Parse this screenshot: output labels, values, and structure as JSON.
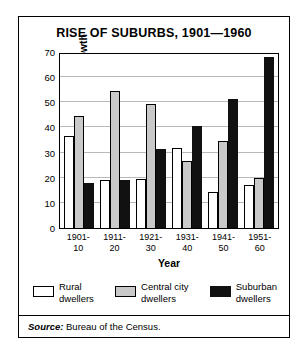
{
  "chart_data": {
    "type": "bar",
    "title": "RISE OF SUBURBS, 1901—1960",
    "xlabel": "Year",
    "ylabel": "Percent of population growth",
    "ylim": [
      0,
      70
    ],
    "yticks": [
      0,
      10,
      20,
      30,
      40,
      50,
      60,
      70
    ],
    "grid": true,
    "legend_position": "bottom",
    "categories": [
      "1901-\n10",
      "1911-\n20",
      "1921-\n30",
      "1931-\n40",
      "1941-\n50",
      "1951-\n60"
    ],
    "category_lines": [
      [
        "1901-",
        "10"
      ],
      [
        "1911-",
        "20"
      ],
      [
        "1921-",
        "30"
      ],
      [
        "1931-",
        "40"
      ],
      [
        "1941-",
        "50"
      ],
      [
        "1951-",
        "60"
      ]
    ],
    "series": [
      {
        "name": "Rural\ndwellers",
        "key": "rural",
        "color": "#ffffff",
        "values": [
          36.5,
          19.0,
          19.5,
          32.0,
          14.5,
          17.0
        ]
      },
      {
        "name": "Central city\ndwellers",
        "key": "central",
        "color": "#c9c9c9",
        "values": [
          44.5,
          54.5,
          49.5,
          26.5,
          34.5,
          20.0
        ]
      },
      {
        "name": "Suburban\ndwellers",
        "key": "suburban",
        "color": "#111111",
        "values": [
          18.0,
          19.0,
          31.5,
          40.5,
          51.5,
          68.0
        ]
      }
    ],
    "source_prefix": "Source:",
    "source_text": " Bureau of the Census."
  }
}
